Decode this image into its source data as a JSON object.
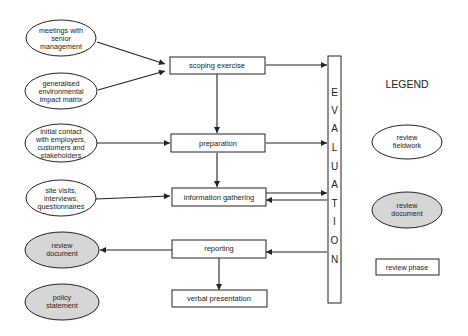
{
  "diagram": {
    "colors": {
      "stroke": "#222222",
      "fill_white": "#ffffff",
      "fill_grey": "#d6d6d6"
    },
    "fieldwork_ellipses": [
      {
        "id": "meetings",
        "lines": [
          "meetings with",
          "senior",
          "management"
        ]
      },
      {
        "id": "matrix",
        "lines": [
          "generalised",
          "environmental",
          "impact matrix"
        ]
      },
      {
        "id": "contact",
        "lines": [
          "initial contact",
          "with employers,",
          "customers and",
          "stakeholders"
        ]
      },
      {
        "id": "visits",
        "lines": [
          "site visits,",
          "interviews,",
          "questionnaires"
        ]
      }
    ],
    "document_ellipses": [
      {
        "id": "review-document",
        "lines": [
          "review",
          "document"
        ]
      },
      {
        "id": "policy-statement",
        "lines": [
          "policy",
          "statement"
        ]
      }
    ],
    "phases": [
      {
        "id": "scoping",
        "label": "scoping exercise"
      },
      {
        "id": "preparation",
        "label": "preparation"
      },
      {
        "id": "information",
        "label": "information gathering"
      },
      {
        "id": "reporting",
        "label": "reporting"
      },
      {
        "id": "presentation",
        "label": "verbal presentation"
      }
    ],
    "evaluation": {
      "letters": [
        "E",
        "V",
        "A",
        "L",
        "U",
        "A",
        "T",
        "I",
        "O",
        "N"
      ]
    },
    "legend": {
      "title": "LEGEND",
      "fieldwork": [
        "review",
        "fieldwork"
      ],
      "document": [
        "review",
        "document"
      ],
      "phase": "review phase"
    }
  }
}
